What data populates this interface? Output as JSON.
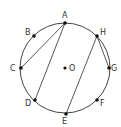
{
  "diagram": {
    "type": "circle-geometry",
    "center": {
      "label": "O",
      "x": 65,
      "y": 68
    },
    "radius": 45,
    "points": [
      {
        "label": "A",
        "x": 65,
        "y": 23,
        "lx": 62,
        "ly": 18
      },
      {
        "label": "B",
        "x": 34,
        "y": 36,
        "lx": 25,
        "ly": 35
      },
      {
        "label": "C",
        "x": 21,
        "y": 68,
        "lx": 10,
        "ly": 71
      },
      {
        "label": "D",
        "x": 35,
        "y": 100,
        "lx": 25,
        "ly": 106
      },
      {
        "label": "E",
        "x": 66,
        "y": 114,
        "lx": 62,
        "ly": 124
      },
      {
        "label": "F",
        "x": 97,
        "y": 100,
        "lx": 100,
        "ly": 106
      },
      {
        "label": "G",
        "x": 109,
        "y": 68,
        "lx": 111,
        "ly": 71
      },
      {
        "label": "H",
        "x": 97,
        "y": 36,
        "lx": 100,
        "ly": 35
      }
    ],
    "segments": [
      [
        "A",
        "C"
      ],
      [
        "A",
        "D"
      ],
      [
        "H",
        "E"
      ],
      [
        "H",
        "G"
      ]
    ],
    "colors": {
      "stroke": "#444444",
      "point": "#111111",
      "label": "#333333"
    }
  }
}
